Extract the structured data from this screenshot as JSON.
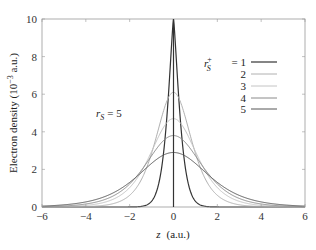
{
  "chart_data": {
    "type": "line",
    "title": "",
    "xlabel": "z  (a.u.)",
    "ylabel": "Electron density (10^-3 a.u.)",
    "xlim": [
      -6,
      6
    ],
    "ylim": [
      0,
      10
    ],
    "xticks": [
      -6,
      -4,
      -2,
      0,
      2,
      4,
      6
    ],
    "yticks": [
      0,
      2,
      4,
      6,
      8,
      10
    ],
    "grid": false,
    "legend_position": "upper right",
    "legend_title": "r_s^+ =",
    "annotation": "r_s = 5",
    "series": [
      {
        "name": "1",
        "peak": 10.0,
        "width": 0.55,
        "color": "#333333"
      },
      {
        "name": "2",
        "peak": 6.1,
        "width": 0.95,
        "color": "#b0b0b0"
      },
      {
        "name": "3",
        "peak": 4.7,
        "width": 1.25,
        "color": "#c4c4c4"
      },
      {
        "name": "4",
        "peak": 3.8,
        "width": 1.5,
        "color": "#8a8a8a"
      },
      {
        "name": "5",
        "peak": 2.9,
        "width": 1.85,
        "color": "#555555"
      }
    ],
    "vertical_line": {
      "x": 0
    }
  },
  "labels": {
    "ylabel_text": "Electron density (10",
    "ylabel_exp": "−3",
    "ylabel_tail": " a.u.)",
    "xlabel_var": "z",
    "xlabel_unit": "(a.u.)",
    "annot_var": "r",
    "annot_sub": "S",
    "annot_val": "= 5",
    "legend_var": "r",
    "legend_sup": "+",
    "legend_sub": "S",
    "legend_eq": "= 1"
  }
}
